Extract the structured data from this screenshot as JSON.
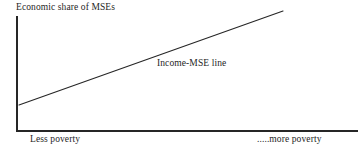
{
  "figure": {
    "width": 362,
    "height": 154,
    "background_color": "#ffffff",
    "ink_color": "#262626"
  },
  "chart_data": {
    "type": "line",
    "title": "",
    "ylabel": "Economic share of MSEs",
    "xlabel": "",
    "grid": false,
    "legend_position": "inline-annotation",
    "axis": {
      "x_axis_from": [
        17,
        131
      ],
      "x_axis_to": [
        358,
        131
      ],
      "y_axis_from": [
        17,
        16
      ],
      "y_axis_to": [
        17,
        131
      ],
      "x_tick_labels": [
        "Less poverty",
        ".....more poverty"
      ],
      "y_tick_labels": []
    },
    "series": [
      {
        "name": "Income-MSE line",
        "points": [
          [
            19,
            105
          ],
          [
            283,
            11
          ]
        ],
        "color": "#262626",
        "width": 1.1,
        "annotation": "Income-MSE line",
        "annotation_position": [
          157,
          63
        ]
      }
    ],
    "annotations": [
      {
        "text": "Economic share of MSEs",
        "position": [
          16,
          7
        ]
      },
      {
        "text": "Income-MSE line",
        "position": [
          157,
          63
        ]
      },
      {
        "text": "Less poverty",
        "position": [
          30,
          139
        ]
      },
      {
        "text": ".....more poverty",
        "position": [
          257,
          139
        ]
      }
    ]
  },
  "labels": {
    "y_axis_title": "Economic share of MSEs",
    "series_label": "Income-MSE line",
    "x_left": "Less poverty",
    "x_right": ".....more poverty"
  }
}
